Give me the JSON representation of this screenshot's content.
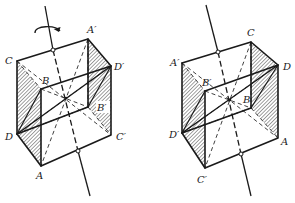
{
  "figure": {
    "left_cube": {
      "rotation_arrow": "curved-arrow",
      "labels": {
        "C": "C",
        "A_prime": "A′",
        "D_prime": "D′",
        "B": "B",
        "B_prime": "B′",
        "D": "D",
        "C_prime": "C′",
        "A": "A"
      }
    },
    "right_cube": {
      "labels": {
        "C": "C",
        "A_prime": "A′",
        "D": "D",
        "B_prime": "B′",
        "B": "B",
        "D_prime": "D′",
        "A": "A",
        "C_prime": "C′"
      }
    }
  }
}
